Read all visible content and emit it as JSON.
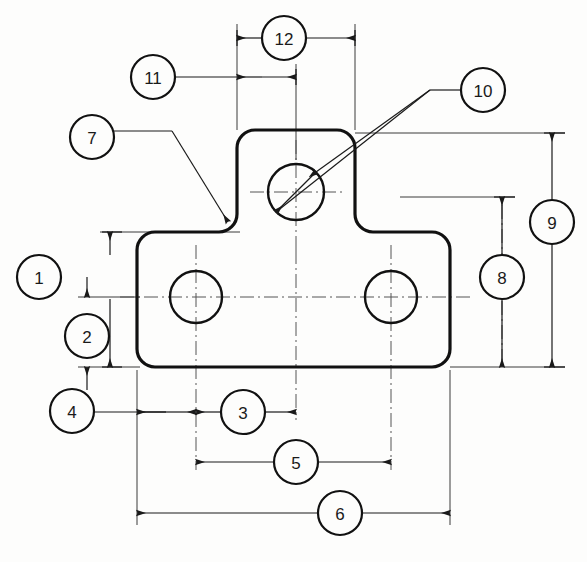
{
  "drawing": {
    "title": "Bracket Dimension Callout Drawing",
    "type": "engineering-drawing",
    "background_color": "#fdfdfc",
    "line_color": "#1a1a1a",
    "outline_color": "#111111",
    "centerline_color": "#555555",
    "dimension_color": "#222222",
    "units": "",
    "part_description": "T-shaped flat bracket plate with three circular holes"
  },
  "balloons": [
    {
      "id": "balloon-1",
      "label": "1",
      "cx": 39,
      "cy": 277,
      "r": 22
    },
    {
      "id": "balloon-2",
      "label": "2",
      "cx": 87,
      "cy": 336,
      "r": 22
    },
    {
      "id": "balloon-3",
      "label": "3",
      "cx": 243,
      "cy": 412,
      "r": 22
    },
    {
      "id": "balloon-4",
      "label": "4",
      "cx": 72,
      "cy": 411,
      "r": 22
    },
    {
      "id": "balloon-5",
      "label": "5",
      "cx": 296,
      "cy": 462,
      "r": 22
    },
    {
      "id": "balloon-6",
      "label": "6",
      "cx": 340,
      "cy": 513,
      "r": 22
    },
    {
      "id": "balloon-7",
      "label": "7",
      "cx": 92,
      "cy": 137,
      "r": 22
    },
    {
      "id": "balloon-8",
      "label": "8",
      "cx": 502,
      "cy": 277,
      "r": 22
    },
    {
      "id": "balloon-9",
      "label": "9",
      "cx": 552,
      "cy": 222,
      "r": 22
    },
    {
      "id": "balloon-10",
      "label": "10",
      "cx": 483,
      "cy": 90,
      "r": 22
    },
    {
      "id": "balloon-11",
      "label": "11",
      "cx": 153,
      "cy": 77,
      "r": 22
    },
    {
      "id": "balloon-12",
      "label": "12",
      "cx": 284,
      "cy": 38,
      "r": 22
    }
  ],
  "part": {
    "body": {
      "left": 137,
      "right": 450,
      "top": 232,
      "bottom": 367,
      "corner_radius": 18
    },
    "boss": {
      "left": 237,
      "right": 355,
      "top": 130,
      "corner_radius": 18
    },
    "fillet_radius": 12
  },
  "holes": [
    {
      "id": "hole-top",
      "cx": 296,
      "cy": 192,
      "r": 28
    },
    {
      "id": "hole-left",
      "cx": 196,
      "cy": 297,
      "r": 26
    },
    {
      "id": "hole-right",
      "cx": 391,
      "cy": 297,
      "r": 26
    }
  ],
  "dimensions": [
    {
      "id": "dim-12",
      "balloon": "12",
      "orientation": "horizontal",
      "y": 38,
      "from": 237,
      "to": 355,
      "note": "boss overall width"
    },
    {
      "id": "dim-11",
      "balloon": "11",
      "orientation": "horizontal",
      "y": 77,
      "from": 237,
      "to": 296,
      "note": "boss left edge to top hole center"
    },
    {
      "id": "dim-3",
      "balloon": "3",
      "orientation": "horizontal",
      "y": 412,
      "from": 196,
      "to": 296,
      "note": "left hole center to top hole center"
    },
    {
      "id": "dim-4",
      "balloon": "4",
      "orientation": "horizontal",
      "y": 412,
      "from": 137,
      "to": 196,
      "note": "body left edge to left hole center"
    },
    {
      "id": "dim-5",
      "balloon": "5",
      "orientation": "horizontal",
      "y": 462,
      "from": 196,
      "to": 391,
      "note": "hole center to hole center"
    },
    {
      "id": "dim-6",
      "balloon": "6",
      "orientation": "horizontal",
      "y": 513,
      "from": 137,
      "to": 450,
      "note": "body overall width"
    },
    {
      "id": "dim-1",
      "balloon": "1",
      "orientation": "vertical",
      "x": 110,
      "from": 232,
      "to": 367,
      "note": "body overall height"
    },
    {
      "id": "dim-2",
      "balloon": "2",
      "orientation": "vertical",
      "x": 87,
      "from": 297,
      "to": 367,
      "note": "bottom edge to hole centerline"
    },
    {
      "id": "dim-8",
      "balloon": "8",
      "orientation": "vertical",
      "x": 502,
      "from": 197,
      "to": 367,
      "note": "top hole centerline to bottom edge"
    },
    {
      "id": "dim-9",
      "balloon": "9",
      "orientation": "vertical",
      "x": 552,
      "from": 133,
      "to": 367,
      "note": "overall height"
    },
    {
      "id": "dim-10",
      "balloon": "10",
      "orientation": "diameter",
      "note": "top hole diameter, leader from balloon 10"
    },
    {
      "id": "dim-7",
      "balloon": "7",
      "orientation": "leader",
      "note": "fillet radius at boss-to-body junction"
    }
  ]
}
